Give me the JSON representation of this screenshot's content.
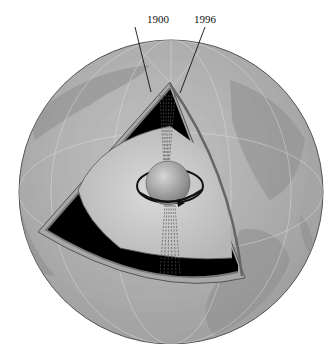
{
  "diagram": {
    "labels": {
      "year_1": "1900",
      "year_2": "1996"
    },
    "layers": [
      "crust",
      "mantle",
      "outer core",
      "inner core"
    ],
    "colors": {
      "globe": "#b4b4b4",
      "mantle": "#000000",
      "outer_core": "#c8c8c8",
      "inner_core": "#9a9a9a",
      "lines": "#222222"
    }
  }
}
